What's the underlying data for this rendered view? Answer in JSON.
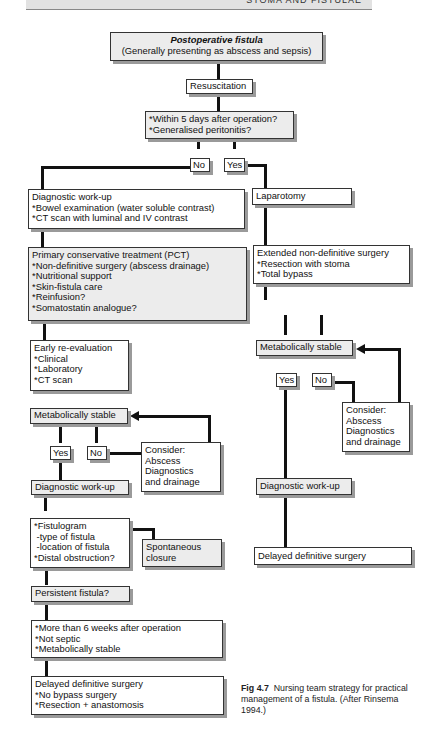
{
  "running_head": "STOMA AND FISTULAE",
  "nodes": {
    "start": {
      "title": "Postoperative fistula",
      "subtitle": "(Generally presenting as abscess and sepsis)"
    },
    "resuscitation": "Resuscitation",
    "decision1": [
      "*Within 5 days after operation?",
      "*Generalised peritonitis?"
    ],
    "no1": "No",
    "yes1": "Yes",
    "diag_workup1": [
      "Diagnostic work-up",
      "*Bowel examination (water soluble contrast)",
      "*CT scan with luminal and IV contrast"
    ],
    "laparotomy": "Laparotomy",
    "pct": [
      "Primary conservative treatment (PCT)",
      "*Non-definitive surgery (abscess drainage)",
      "*Nutritional support",
      "*Skin-fistula care",
      "*Reinfusion?",
      "*Somatostatin analogue?"
    ],
    "extended": [
      "Extended non-definitive surgery",
      "*Resection with stoma",
      "*Total bypass"
    ],
    "early_reeval": [
      "Early re-evaluation",
      "*Clinical",
      "*Laboratory",
      "*CT scan"
    ],
    "metab_right": "Metabolically stable",
    "yes_right": "Yes",
    "no_right": "No",
    "consider_right": [
      "Consider:",
      "Abscess",
      "Diagnostics",
      "and drainage"
    ],
    "metab_left": "Metabolically stable",
    "yes_left": "Yes",
    "no_left": "No",
    "consider_left": [
      "Consider:",
      "Abscess",
      "Diagnostics",
      "and drainage"
    ],
    "diag_workup_left": "Diagnostic work-up",
    "diag_workup_right": "Diagnostic work-up",
    "fistulogram": [
      "*Fistulogram",
      " -type of fistula",
      " -location of fistula",
      "*Distal obstruction?"
    ],
    "spontaneous": [
      "Spontaneous",
      "closure"
    ],
    "delayed_right": "Delayed definitive surgery",
    "persistent": "Persistent fistula?",
    "criteria": [
      "*More than 6 weeks after operation",
      "*Not septic",
      "*Metabolically stable"
    ],
    "delayed_left": [
      "Delayed definitive surgery",
      "*No bypass surgery",
      "*Resection + anastomosis"
    ]
  },
  "caption": {
    "label": "Fig 4.7",
    "text": "Nursing team strategy for practical management of a fistula. (After Rinsema 1994.)"
  }
}
